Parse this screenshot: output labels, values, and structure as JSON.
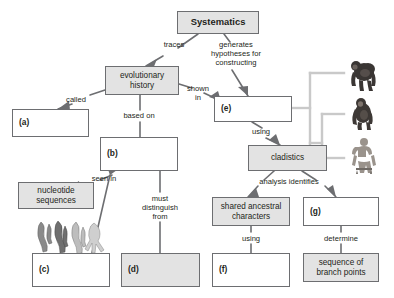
{
  "diagram": {
    "type": "concept-map",
    "colors": {
      "node_fill": "#e3e3e3",
      "node_blank": "#ffffff",
      "node_border": "#6d6e71",
      "connector": "#6d6e71",
      "cladogram_line": "#c9c9c9",
      "background": "#ffffff"
    },
    "nodes": [
      {
        "id": "systematics",
        "label": "Systematics",
        "style": "filled",
        "x": 177,
        "y": 11,
        "w": 82,
        "h": 23
      },
      {
        "id": "evolutionary",
        "label": "evolutionary\nhistory",
        "style": "filled",
        "x": 105,
        "y": 66,
        "w": 74,
        "h": 29
      },
      {
        "id": "a",
        "label": "(a)",
        "style": "plain",
        "x": 12,
        "y": 109,
        "w": 77,
        "h": 28
      },
      {
        "id": "b",
        "label": "(b)",
        "style": "plain",
        "x": 100,
        "y": 137,
        "w": 78,
        "h": 34
      },
      {
        "id": "e",
        "label": "(e)",
        "style": "plain",
        "x": 214,
        "y": 96,
        "w": 78,
        "h": 26
      },
      {
        "id": "cladistics",
        "label": "cladistics",
        "style": "filled",
        "x": 248,
        "y": 145,
        "w": 79,
        "h": 26
      },
      {
        "id": "nucleotide",
        "label": "nucleotide\nsequences",
        "style": "filled",
        "x": 18,
        "y": 182,
        "w": 76,
        "h": 27
      },
      {
        "id": "shared",
        "label": "shared ancestral\ncharacters",
        "style": "filled",
        "x": 212,
        "y": 197,
        "w": 78,
        "h": 29
      },
      {
        "id": "g",
        "label": "(g)",
        "style": "plain",
        "x": 303,
        "y": 197,
        "w": 76,
        "h": 29
      },
      {
        "id": "c",
        "label": "(c)",
        "style": "plain",
        "x": 32,
        "y": 253,
        "w": 78,
        "h": 34
      },
      {
        "id": "d",
        "label": "(d)",
        "style": "filled",
        "x": 121,
        "y": 253,
        "w": 79,
        "h": 34
      },
      {
        "id": "f",
        "label": "(f)",
        "style": "plain",
        "x": 212,
        "y": 253,
        "w": 78,
        "h": 34
      },
      {
        "id": "sequence",
        "label": "sequence of\nbranch points",
        "style": "filled",
        "x": 303,
        "y": 253,
        "w": 76,
        "h": 29
      }
    ],
    "edge_labels": [
      {
        "id": "traces",
        "text": "traces",
        "x": 152,
        "y": 40,
        "w": 44
      },
      {
        "id": "generates",
        "text": "generates\nhypotheses for\nconstructing",
        "x": 201,
        "y": 40,
        "w": 70
      },
      {
        "id": "called",
        "text": "called",
        "x": 58,
        "y": 95,
        "w": 36
      },
      {
        "id": "shown-in",
        "text": "shown\nin",
        "x": 181,
        "y": 84,
        "w": 34
      },
      {
        "id": "based-on",
        "text": "based on",
        "x": 114,
        "y": 111,
        "w": 50
      },
      {
        "id": "using-e",
        "text": "using",
        "x": 244,
        "y": 127,
        "w": 34
      },
      {
        "id": "seen-in",
        "text": "seen in",
        "x": 84,
        "y": 174,
        "w": 40
      },
      {
        "id": "analysis",
        "text": "analysis identifies",
        "x": 248,
        "y": 177,
        "w": 82
      },
      {
        "id": "must",
        "text": "must\ndistinguish\nfrom",
        "x": 133,
        "y": 194,
        "w": 54
      },
      {
        "id": "using-f",
        "text": "using",
        "x": 234,
        "y": 234,
        "w": 34
      },
      {
        "id": "determine",
        "text": "determine",
        "x": 315,
        "y": 234,
        "w": 52
      }
    ],
    "cladogram": {
      "taxa": [
        "gorilla",
        "chimpanzee",
        "human"
      ],
      "root_x": 292,
      "tip_x": 344
    },
    "artwork": [
      {
        "id": "homologous-limbs",
        "caption": "four homologous vertebrate forelimb drawings",
        "x": 36,
        "y": 221,
        "w": 72,
        "h": 32
      },
      {
        "id": "gorilla-figure",
        "caption": "gorilla",
        "x": 348,
        "y": 58,
        "w": 32,
        "h": 34
      },
      {
        "id": "chimp-figure",
        "caption": "chimpanzee",
        "x": 350,
        "y": 98,
        "w": 28,
        "h": 32
      },
      {
        "id": "human-figure",
        "caption": "human",
        "x": 350,
        "y": 138,
        "w": 28,
        "h": 36
      }
    ]
  }
}
